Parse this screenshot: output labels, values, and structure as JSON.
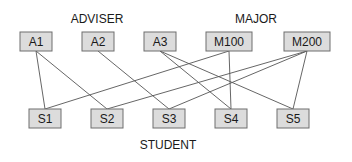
{
  "diagram": {
    "groups": {
      "adviser": "ADVISER",
      "major": "MAJOR",
      "student": "STUDENT"
    },
    "top_nodes": [
      {
        "id": "A1",
        "label": "A1",
        "group": "adviser"
      },
      {
        "id": "A2",
        "label": "A2",
        "group": "adviser"
      },
      {
        "id": "A3",
        "label": "A3",
        "group": "adviser"
      },
      {
        "id": "M100",
        "label": "M100",
        "group": "major"
      },
      {
        "id": "M200",
        "label": "M200",
        "group": "major"
      }
    ],
    "bottom_nodes": [
      {
        "id": "S1",
        "label": "S1",
        "group": "student"
      },
      {
        "id": "S2",
        "label": "S2",
        "group": "student"
      },
      {
        "id": "S3",
        "label": "S3",
        "group": "student"
      },
      {
        "id": "S4",
        "label": "S4",
        "group": "student"
      },
      {
        "id": "S5",
        "label": "S5",
        "group": "student"
      }
    ],
    "edges": [
      {
        "from": "A1",
        "to": "S1"
      },
      {
        "from": "A1",
        "to": "S2"
      },
      {
        "from": "A2",
        "to": "S3"
      },
      {
        "from": "A3",
        "to": "S4"
      },
      {
        "from": "A3",
        "to": "S5"
      },
      {
        "from": "M100",
        "to": "S1"
      },
      {
        "from": "M100",
        "to": "S4"
      },
      {
        "from": "M200",
        "to": "S2"
      },
      {
        "from": "M200",
        "to": "S3"
      },
      {
        "from": "M200",
        "to": "S5"
      }
    ],
    "colors": {
      "node_fill": "#dcdcdc",
      "node_stroke": "#6e6e6e",
      "edge": "#555555"
    }
  }
}
